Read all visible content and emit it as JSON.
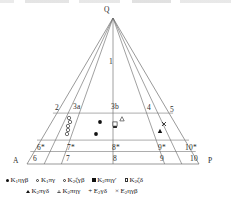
{
  "figure": {
    "type": "ternary-qap-diagram",
    "apex_label": "Q",
    "left_corner_label": "A",
    "right_corner_label": "P"
  },
  "fields": {
    "upper": [
      {
        "id": "f1",
        "label": "1",
        "x": 111,
        "y": 57
      }
    ],
    "middle": [
      {
        "id": "f2",
        "label": "2",
        "x": 58,
        "y": 103
      },
      {
        "id": "f3a",
        "label": "3a",
        "x": 79,
        "y": 102
      },
      {
        "id": "f3b",
        "label": "3b",
        "x": 117,
        "y": 102
      },
      {
        "id": "f4",
        "label": "4",
        "x": 150,
        "y": 103
      },
      {
        "id": "f5",
        "label": "5",
        "x": 172,
        "y": 104
      }
    ],
    "lower": [
      {
        "id": "f6s",
        "label": "6*",
        "x": 42,
        "y": 146
      },
      {
        "id": "f7s",
        "label": "7*",
        "x": 72,
        "y": 146
      },
      {
        "id": "f8s",
        "label": "8*",
        "x": 117,
        "y": 146
      },
      {
        "id": "f9s",
        "label": "9*",
        "x": 163,
        "y": 146
      },
      {
        "id": "f10s",
        "label": "10*",
        "x": 192,
        "y": 146
      }
    ],
    "base": [
      {
        "id": "f6",
        "label": "6",
        "x": 36,
        "y": 159
      },
      {
        "id": "f7",
        "label": "7",
        "x": 69,
        "y": 159
      },
      {
        "id": "f8",
        "label": "8",
        "x": 116,
        "y": 159
      },
      {
        "id": "f9",
        "label": "9",
        "x": 163,
        "y": 159
      },
      {
        "id": "f10",
        "label": "10",
        "x": 196,
        "y": 159
      }
    ]
  },
  "legend": {
    "row1": [
      {
        "symbol": "filled-circle",
        "prefix": "K",
        "sub": "1",
        "suffix": "ηγβ"
      },
      {
        "symbol": "open-circle",
        "prefix": "K",
        "sub": "1",
        "suffix": "πγ"
      },
      {
        "symbol": "open-circle",
        "prefix": "K",
        "sub": "2",
        "suffix": "ζγβ"
      },
      {
        "symbol": "filled-square",
        "prefix": "K",
        "sub": "2",
        "suffix": "πηγ′"
      },
      {
        "symbol": "open-square",
        "prefix": "K",
        "sub": "2",
        "suffix": "ζδ"
      }
    ],
    "row2": [
      {
        "symbol": "filled-triangle",
        "prefix": "K",
        "sub": "2",
        "suffix": "πγδ"
      },
      {
        "symbol": "open-triangle",
        "prefix": "K",
        "sub": "2",
        "suffix": "πηγ"
      },
      {
        "symbol": "plus",
        "prefix": "E",
        "sub": "2",
        "suffix": "γδ"
      },
      {
        "symbol": "times",
        "prefix": "E",
        "sub": "2",
        "suffix": "ηγβ"
      }
    ]
  },
  "chart_data": {
    "type": "scatter",
    "title": "",
    "xlabel": "A — P",
    "ylabel": "Q",
    "points": [
      {
        "marker": "open-circle",
        "x": 69,
        "y": 118
      },
      {
        "marker": "open-circle",
        "x": 70,
        "y": 122
      },
      {
        "marker": "open-circle",
        "x": 68,
        "y": 126
      },
      {
        "marker": "open-circle",
        "x": 68,
        "y": 130
      },
      {
        "marker": "open-circle",
        "x": 67,
        "y": 134
      },
      {
        "marker": "filled-circle",
        "x": 100,
        "y": 122
      },
      {
        "marker": "filled-circle",
        "x": 96,
        "y": 134
      },
      {
        "marker": "filled-square",
        "x": 115,
        "y": 126
      },
      {
        "marker": "open-square",
        "x": 115,
        "y": 124
      },
      {
        "marker": "open-triangle",
        "x": 122,
        "y": 119
      },
      {
        "marker": "times",
        "x": 164,
        "y": 124
      },
      {
        "marker": "filled-triangle",
        "x": 160,
        "y": 131
      }
    ]
  }
}
